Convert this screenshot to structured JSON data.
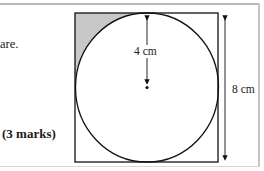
{
  "question": {
    "text_fragment": "are.",
    "marks_label": "(3 marks)"
  },
  "figure": {
    "radius_label": "4 cm",
    "side_label": "8 cm",
    "shaded_color": "#c8c8c8",
    "line_color": "#111111"
  }
}
